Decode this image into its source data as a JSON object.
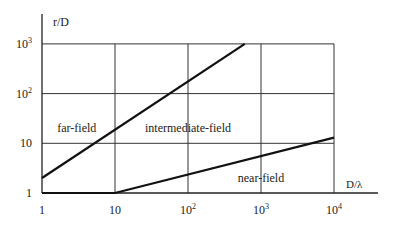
{
  "chart_data": {
    "type": "line",
    "title": "",
    "xlabel": "D/λ",
    "ylabel": "r/D",
    "xscale": "log",
    "yscale": "log",
    "xlim": [
      1,
      30000
    ],
    "ylim": [
      1,
      1000
    ],
    "grid": true,
    "x_ticks": [
      {
        "value": 1,
        "base": "1",
        "exp": ""
      },
      {
        "value": 10,
        "base": "10",
        "exp": ""
      },
      {
        "value": 100,
        "base": "10",
        "exp": "2"
      },
      {
        "value": 1000,
        "base": "10",
        "exp": "3"
      },
      {
        "value": 10000,
        "base": "10",
        "exp": "4"
      }
    ],
    "y_ticks": [
      {
        "value": 1,
        "base": "1",
        "exp": ""
      },
      {
        "value": 10,
        "base": "10",
        "exp": ""
      },
      {
        "value": 100,
        "base": "10",
        "exp": "2"
      },
      {
        "value": 1000,
        "base": "10",
        "exp": "3"
      }
    ],
    "series": [
      {
        "name": "far-field / intermediate boundary",
        "x": [
          1,
          600
        ],
        "y": [
          2,
          1000
        ]
      },
      {
        "name": "intermediate / near-field boundary",
        "x": [
          1,
          10,
          10000
        ],
        "y": [
          1,
          1,
          13
        ]
      }
    ],
    "annotations": [
      {
        "text": "far-field",
        "x": 3,
        "y": 20
      },
      {
        "text": "intermediate-field",
        "x": 100,
        "y": 20
      },
      {
        "text": "near-field",
        "x": 1000,
        "y": 2
      }
    ]
  }
}
